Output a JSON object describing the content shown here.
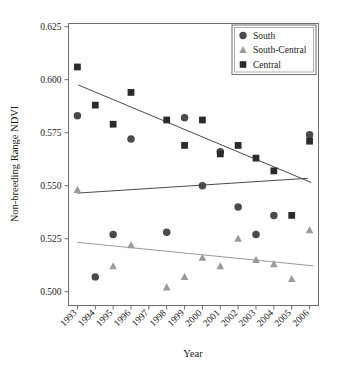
{
  "chart_data": {
    "type": "scatter",
    "title": "",
    "xlabel": "Year",
    "ylabel": "Non-breeding Range NDVI",
    "xlim": [
      1992.5,
      2006.5
    ],
    "ylim": [
      0.4935,
      0.6265
    ],
    "grid": false,
    "legend_position": "top-right",
    "x_tick_labels": [
      "1993",
      "1994",
      "1995",
      "1996",
      "1997",
      "1998",
      "1999",
      "2000",
      "2001",
      "2002",
      "2003",
      "2004",
      "2005",
      "2006"
    ],
    "y_tick_labels": [
      "0.500",
      "0.525",
      "0.550",
      "0.575",
      "0.600",
      "0.625"
    ],
    "y_ticks": [
      0.5,
      0.525,
      0.55,
      0.575,
      0.6,
      0.625
    ],
    "x_ticks": [
      1993,
      1994,
      1995,
      1996,
      1997,
      1998,
      1999,
      2000,
      2001,
      2002,
      2003,
      2004,
      2005,
      2006
    ],
    "series": [
      {
        "name": "South",
        "marker": "circle",
        "color": "#4a4a4a",
        "x": [
          1993,
          1994,
          1995,
          1996,
          1998,
          1999,
          2000,
          2001,
          2002,
          2003,
          2004,
          2006
        ],
        "values": [
          0.583,
          0.507,
          0.527,
          0.572,
          0.528,
          0.582,
          0.55,
          0.566,
          0.54,
          0.527,
          0.536,
          0.574
        ]
      },
      {
        "name": "South-Central",
        "marker": "triangle",
        "color": "#9a9a9a",
        "x": [
          1993,
          1995,
          1996,
          1998,
          1999,
          2000,
          2001,
          2002,
          2003,
          2004,
          2005,
          2006
        ],
        "values": [
          0.548,
          0.512,
          0.522,
          0.502,
          0.507,
          0.516,
          0.512,
          0.525,
          0.515,
          0.513,
          0.506,
          0.529
        ]
      },
      {
        "name": "Central",
        "marker": "square",
        "color": "#2b2b2b",
        "x": [
          1993,
          1994,
          1995,
          1996,
          1998,
          1999,
          2000,
          2001,
          2002,
          2003,
          2004,
          2005,
          2006
        ],
        "values": [
          0.606,
          0.588,
          0.579,
          0.594,
          0.581,
          0.569,
          0.581,
          0.565,
          0.569,
          0.563,
          0.557,
          0.536,
          0.571
        ]
      }
    ],
    "trendlines": [
      {
        "name": "Central trend",
        "color": "#4a4a4a",
        "x": [
          1993.05,
          2006.1
        ],
        "y": [
          0.5975,
          0.5515
        ]
      },
      {
        "name": "South-Central trend",
        "color": "#4a4a4a",
        "x": [
          1993.0,
          2005.9
        ],
        "y": [
          0.5465,
          0.5535
        ]
      },
      {
        "name": "South trend",
        "color": "#9a9a9a",
        "x": [
          1993.0,
          2006.2
        ],
        "y": [
          0.5233,
          0.5122
        ]
      }
    ],
    "legend_entries": [
      {
        "label": "South",
        "marker": "circle",
        "color": "#4a4a4a"
      },
      {
        "label": "South-Central",
        "marker": "triangle",
        "color": "#9a9a9a"
      },
      {
        "label": "Central",
        "marker": "square",
        "color": "#2b2b2b"
      }
    ],
    "axis_color": "#6f6f6f"
  }
}
